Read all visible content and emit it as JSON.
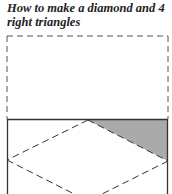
{
  "title": "How to make a diamond and 4 right triangles",
  "figure": {
    "shade_color": "#aaaaaa",
    "line_color": "#333333"
  }
}
